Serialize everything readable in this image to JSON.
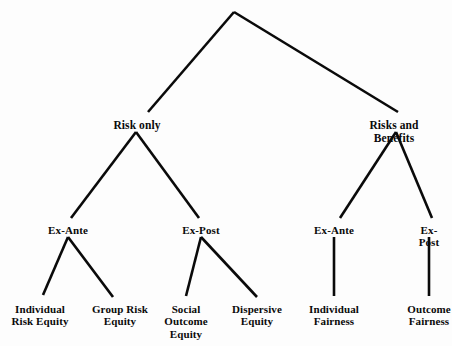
{
  "diagram": {
    "type": "hierarchy-tree",
    "title": "",
    "background_color": "#fdfdfd",
    "line_color": "#0a0a0a",
    "text_color": "#0a0a0a",
    "root": {
      "label": "",
      "x": 234,
      "y": 12
    },
    "nodes": [
      {
        "id": "risk-only",
        "label": "Risk only",
        "level": 1,
        "x": 137,
        "y": 119
      },
      {
        "id": "risks-and-benefits",
        "label": "Risks and Benefits",
        "level": 1,
        "x": 394,
        "y": 119
      },
      {
        "id": "ex-ante-risk",
        "label": "Ex-Ante",
        "level": 2,
        "x": 68,
        "y": 224
      },
      {
        "id": "ex-post-risk",
        "label": "Ex-Post",
        "level": 2,
        "x": 201,
        "y": 224
      },
      {
        "id": "ex-ante-benefits",
        "label": "Ex-Ante",
        "level": 2,
        "x": 334,
        "y": 224
      },
      {
        "id": "ex-post-benefits",
        "label": "Ex-Post",
        "level": 2,
        "x": 429,
        "y": 224
      },
      {
        "id": "individual-risk-equity",
        "label": "Individual\nRisk Equity",
        "level": 3,
        "x": 40,
        "y": 303
      },
      {
        "id": "group-risk-equity",
        "label": "Group Risk\nEquity",
        "level": 3,
        "x": 120,
        "y": 303
      },
      {
        "id": "social-outcome-equity",
        "label": "Social\nOutcome\nEquity",
        "level": 3,
        "x": 186,
        "y": 303
      },
      {
        "id": "dispersive-equity",
        "label": "Dispersive\nEquity",
        "level": 3,
        "x": 257,
        "y": 303
      },
      {
        "id": "individual-fairness",
        "label": "Individual\nFairness",
        "level": 3,
        "x": 334,
        "y": 303
      },
      {
        "id": "outcome-fairness",
        "label": "Outcome\nFairness",
        "level": 3,
        "x": 429,
        "y": 303
      }
    ],
    "edges": [
      {
        "id": "root-to-risk-only",
        "from": "root",
        "to": "risk-only",
        "x1": 234,
        "y1": 12,
        "x2": 148,
        "y2": 112,
        "width": 2.6
      },
      {
        "id": "root-to-risks-and-benefits",
        "from": "root",
        "to": "risks-and-benefits",
        "x1": 234,
        "y1": 12,
        "x2": 398,
        "y2": 112,
        "width": 2.6
      },
      {
        "id": "risk-only-to-ex-ante",
        "from": "risk-only",
        "to": "ex-ante-risk",
        "x1": 136,
        "y1": 132,
        "x2": 71,
        "y2": 218,
        "width": 2.6
      },
      {
        "id": "risk-only-to-ex-post",
        "from": "risk-only",
        "to": "ex-post-risk",
        "x1": 136,
        "y1": 132,
        "x2": 199,
        "y2": 218,
        "width": 2.6
      },
      {
        "id": "benefits-to-ex-ante",
        "from": "risks-and-benefits",
        "to": "ex-ante-benefits",
        "x1": 396,
        "y1": 132,
        "x2": 340,
        "y2": 218,
        "width": 2.6
      },
      {
        "id": "benefits-to-ex-post",
        "from": "risks-and-benefits",
        "to": "ex-post-benefits",
        "x1": 396,
        "y1": 132,
        "x2": 432,
        "y2": 218,
        "width": 2.6
      },
      {
        "id": "ex-ante-to-individual-risk",
        "from": "ex-ante-risk",
        "to": "individual-risk-equity",
        "x1": 68,
        "y1": 237,
        "x2": 43,
        "y2": 295,
        "width": 2.6
      },
      {
        "id": "ex-ante-to-group-risk",
        "from": "ex-ante-risk",
        "to": "group-risk-equity",
        "x1": 68,
        "y1": 237,
        "x2": 113,
        "y2": 297,
        "width": 2.6
      },
      {
        "id": "ex-post-to-social-outcome",
        "from": "ex-post-risk",
        "to": "social-outcome-equity",
        "x1": 201,
        "y1": 237,
        "x2": 186,
        "y2": 296,
        "width": 2.6
      },
      {
        "id": "ex-post-to-dispersive",
        "from": "ex-post-risk",
        "to": "dispersive-equity",
        "x1": 201,
        "y1": 237,
        "x2": 257,
        "y2": 297,
        "width": 2.6
      },
      {
        "id": "ex-ante-b-to-individual-fair",
        "from": "ex-ante-benefits",
        "to": "individual-fairness",
        "x1": 334,
        "y1": 237,
        "x2": 334,
        "y2": 296,
        "width": 2.6
      },
      {
        "id": "ex-post-b-to-outcome-fair",
        "from": "ex-post-benefits",
        "to": "outcome-fairness",
        "x1": 429,
        "y1": 237,
        "x2": 429,
        "y2": 296,
        "width": 2.6
      }
    ]
  }
}
